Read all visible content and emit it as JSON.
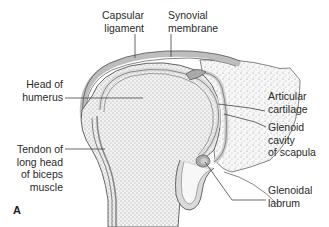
{
  "figure": {
    "panel_letter": "A",
    "colors": {
      "bone_fill": "#f4f4f4",
      "stipple": "#9a9a9a",
      "capsule": "#bdbdbd",
      "outline": "#555555",
      "leader_line": "#444444"
    },
    "labels": {
      "capsular_ligament": "Capsular\nligament",
      "synovial_membrane": "Synovial\nmembrane",
      "head_of_humerus": "Head of\nhumerus",
      "articular_cartilage": "Articular\ncartilage",
      "glenoid_cavity": "Glenoid\ncavity\nof scapula",
      "tendon_biceps": "Tendon of\nlong head\nof biceps\nmuscle",
      "glenoidal_labrum": "Glenoidal\nlabrum"
    }
  }
}
